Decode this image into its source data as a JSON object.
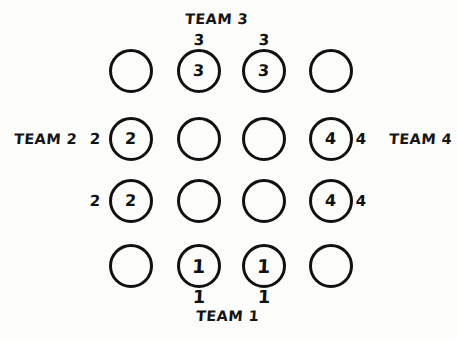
{
  "diagram": {
    "title_team_top": "TEAM 3",
    "title_team_bottom": "TEAM 1",
    "title_team_left": "TEAM 2",
    "title_team_right": "TEAM 4",
    "background_color": "#fcfcfa",
    "ink_color": "#111111",
    "grid": {
      "rows": 4,
      "columns": 4,
      "cells": [
        [
          {
            "label": "",
            "filled": false
          },
          {
            "label": "3",
            "filled": true
          },
          {
            "label": "3",
            "filled": true
          },
          {
            "label": "",
            "filled": false
          }
        ],
        [
          {
            "label": "2",
            "filled": true
          },
          {
            "label": "",
            "filled": false
          },
          {
            "label": "",
            "filled": false
          },
          {
            "label": "4",
            "filled": true
          }
        ],
        [
          {
            "label": "2",
            "filled": true
          },
          {
            "label": "",
            "filled": false
          },
          {
            "label": "",
            "filled": false
          },
          {
            "label": "4",
            "filled": true
          }
        ],
        [
          {
            "label": "",
            "filled": false
          },
          {
            "label": "1",
            "filled": true
          },
          {
            "label": "1",
            "filled": true
          },
          {
            "label": "",
            "filled": false
          }
        ]
      ]
    },
    "edge_marks": {
      "top": [
        {
          "label": "3",
          "column": 2
        },
        {
          "label": "3",
          "column": 3
        }
      ],
      "bottom": [
        {
          "label": "1",
          "column": 2
        },
        {
          "label": "1",
          "column": 3
        }
      ],
      "left": [
        {
          "label": "2",
          "row": 2
        },
        {
          "label": "2",
          "row": 3
        }
      ],
      "right": [
        {
          "label": "4",
          "row": 2
        },
        {
          "label": "4",
          "row": 3
        }
      ]
    }
  }
}
